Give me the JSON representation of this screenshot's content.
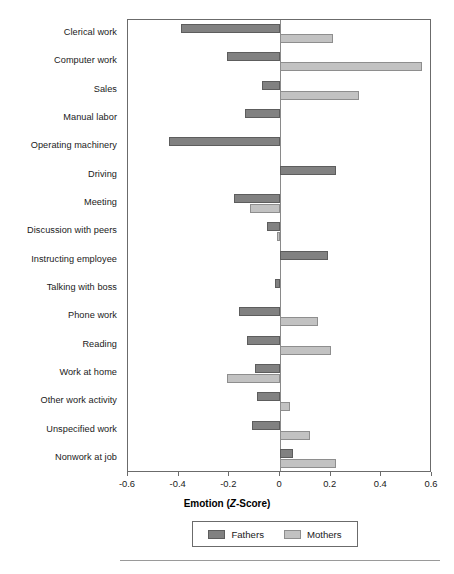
{
  "chart_data": {
    "type": "bar",
    "orientation": "horizontal",
    "title": "",
    "xlabel": "Emotion (Z-Score)",
    "ylabel": "",
    "xlim": [
      -0.6,
      0.6
    ],
    "xticks": [
      "-0.6",
      "-0.4",
      "-0.2",
      "0",
      "0.2",
      "0.4",
      "0.6"
    ],
    "xtick_values": [
      -0.6,
      -0.4,
      -0.2,
      0,
      0.2,
      0.4,
      0.6
    ],
    "grid": false,
    "legend_position": "bottom",
    "categories": [
      "Clerical work",
      "Computer work",
      "Sales",
      "Manual labor",
      "Operating machinery",
      "Driving",
      "Meeting",
      "Discussion with peers",
      "Instructing employee",
      "Talking with boss",
      "Phone work",
      "Reading",
      "Work at home",
      "Other work activity",
      "Unspecified work",
      "Nonwork at job"
    ],
    "series": [
      {
        "name": "Fathers",
        "color": "#818181",
        "values": [
          -0.39,
          -0.21,
          -0.07,
          -0.14,
          -0.44,
          0.22,
          -0.18,
          -0.05,
          0.19,
          -0.02,
          -0.16,
          -0.13,
          -0.1,
          -0.09,
          -0.11,
          0.05
        ]
      },
      {
        "name": "Mothers",
        "color": "#c2c2c2",
        "values": [
          0.21,
          0.56,
          0.31,
          0.0,
          0.0,
          0.0,
          -0.12,
          -0.01,
          0.0,
          0.0,
          0.15,
          0.2,
          -0.21,
          0.04,
          0.12,
          0.22
        ]
      }
    ]
  },
  "legend": {
    "entries": [
      {
        "label": "Fathers",
        "swatch": "fathers"
      },
      {
        "label": "Mothers",
        "swatch": "mothers"
      }
    ]
  },
  "axis": {
    "title_prefix": "Emotion (",
    "title_italic": "Z",
    "title_suffix": "-Score)"
  }
}
